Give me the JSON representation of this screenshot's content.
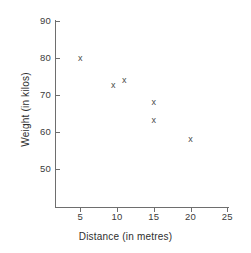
{
  "chart_data": {
    "type": "scatter",
    "title": "",
    "xlabel": "Distance (in metres)",
    "ylabel": "Weight (in kilos)",
    "xlim": [
      0,
      26
    ],
    "ylim": [
      44,
      92
    ],
    "xticks": [
      5,
      10,
      15,
      20,
      25
    ],
    "yticks": [
      50,
      60,
      70,
      80,
      90
    ],
    "xtick_labels": [
      "5",
      "10",
      "15",
      "20",
      "25"
    ],
    "ytick_labels": [
      "50",
      "60",
      "70",
      "80",
      "90"
    ],
    "grid": false,
    "legend": false,
    "marker": "x",
    "marker_glyph": "x",
    "marker_color": "#4a4a4a",
    "axis_color": "#6e6e6e",
    "background": "#ffffff",
    "points": [
      {
        "x": 5,
        "y": 80
      },
      {
        "x": 9.5,
        "y": 72.5
      },
      {
        "x": 11,
        "y": 74
      },
      {
        "x": 15,
        "y": 68
      },
      {
        "x": 15,
        "y": 63
      },
      {
        "x": 20,
        "y": 58
      }
    ]
  }
}
